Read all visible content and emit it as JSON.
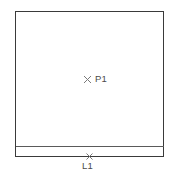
{
  "drawing": {
    "background_color": "#ffffff",
    "stroke_color": "#3a3a3a",
    "divider_stroke_color": "#5a5a5a",
    "marker_color": "#7a7a7a",
    "text_color": "#4a4a4a",
    "stroke_width": 1,
    "outline": {
      "name": "main-rectangle",
      "x": 15,
      "y": 11,
      "width": 149,
      "height": 146
    },
    "divider": {
      "name": "horizontal-divider",
      "x1": 15,
      "y1": 146,
      "x2": 164,
      "y2": 146
    },
    "markers": [
      {
        "id": "P1",
        "type": "point",
        "glyph": "cross-marker",
        "label": "P1",
        "x": 87,
        "y": 79,
        "label_x": 95,
        "label_y": 74
      },
      {
        "id": "L1",
        "type": "line",
        "glyph": "cross-marker",
        "label": "L1",
        "x": 89,
        "y": 156,
        "label_x": 82,
        "label_y": 161
      }
    ]
  }
}
